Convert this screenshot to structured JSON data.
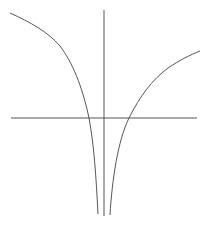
{
  "figure": {
    "colors": {
      "background": "#ffffff",
      "axes": "#555555",
      "curve": "#555555"
    }
  },
  "axes": {
    "x_axis": {
      "x1": 11,
      "y1": 118,
      "x2": 197,
      "y2": 118
    },
    "y_axis": {
      "x1": 104,
      "y1": 10,
      "x2": 104,
      "y2": 216
    }
  },
  "curves": {
    "left_branch": "M10,13 C30,22 48,32 60,46 C72,62 82,85 89,118 C94,145 96,175 98,214",
    "right_branch": "M110,215 C112,180 118,140 129,118 C140,96 152,80 168,68 C180,60 190,55 200,51"
  }
}
